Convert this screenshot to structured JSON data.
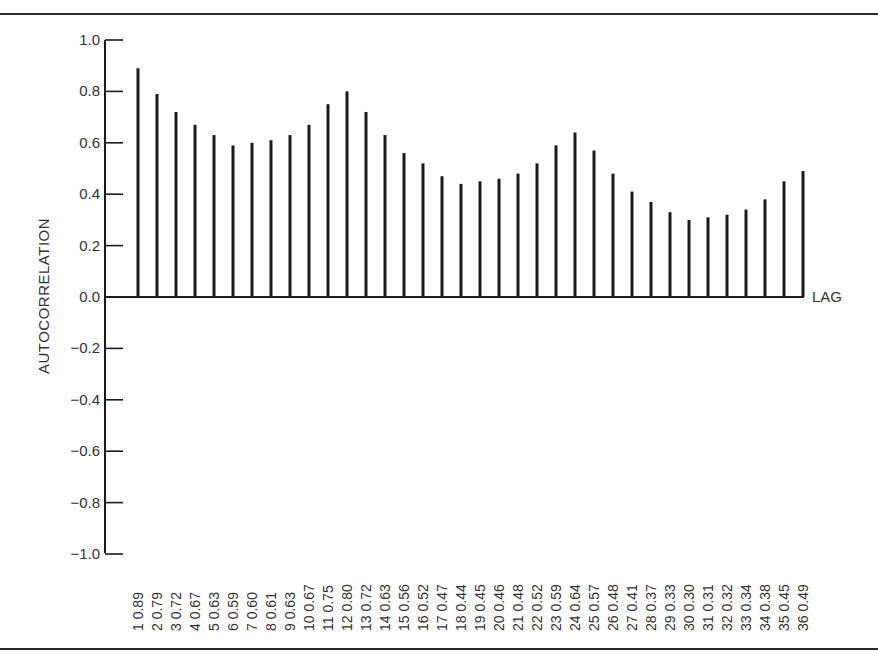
{
  "chart_data": {
    "type": "bar",
    "title": "",
    "xlabel": "LAG",
    "ylabel": "AUTOCORRELATION",
    "ylim": [
      -1.0,
      1.0
    ],
    "yticks": [
      "1.0",
      "0.8",
      "0.6",
      "0.4",
      "0.2",
      "0.0",
      "−0.2",
      "−0.4",
      "−0.6",
      "−0.8",
      "−1.0"
    ],
    "ytick_values": [
      1.0,
      0.8,
      0.6,
      0.4,
      0.2,
      0.0,
      -0.2,
      -0.4,
      -0.6,
      -0.8,
      -1.0
    ],
    "grid": false,
    "legend": null,
    "categories": [
      1,
      2,
      3,
      4,
      5,
      6,
      7,
      8,
      9,
      10,
      11,
      12,
      13,
      14,
      15,
      16,
      17,
      18,
      19,
      20,
      21,
      22,
      23,
      24,
      25,
      26,
      27,
      28,
      29,
      30,
      31,
      32,
      33,
      34,
      35,
      36
    ],
    "values": [
      0.89,
      0.79,
      0.72,
      0.67,
      0.63,
      0.59,
      0.6,
      0.61,
      0.63,
      0.67,
      0.75,
      0.8,
      0.72,
      0.63,
      0.56,
      0.52,
      0.47,
      0.44,
      0.45,
      0.46,
      0.48,
      0.52,
      0.59,
      0.64,
      0.57,
      0.48,
      0.41,
      0.37,
      0.33,
      0.3,
      0.31,
      0.32,
      0.34,
      0.38,
      0.45,
      0.49
    ],
    "tick_labels": [
      "1 0.89",
      "2 0.79",
      "3 0.72",
      "4 0.67",
      "5 0.63",
      "6 0.59",
      "7 0.60",
      "8 0.61",
      "9 0.63",
      "10 0.67",
      "11 0.75",
      "12 0.80",
      "13 0.72",
      "14 0.63",
      "15 0.56",
      "16 0.52",
      "17 0.47",
      "18 0.44",
      "19 0.45",
      "20 0.46",
      "21 0.48",
      "22 0.52",
      "23 0.59",
      "24 0.64",
      "25 0.57",
      "26 0.48",
      "27 0.41",
      "28 0.37",
      "29 0.33",
      "30 0.30",
      "31 0.31",
      "32 0.32",
      "33 0.34",
      "34 0.38",
      "35 0.45",
      "36 0.49"
    ]
  },
  "labels": {
    "ylabel": "AUTOCORRELATION",
    "xlabel": "LAG"
  },
  "colors": {
    "ink": "#1a1a1a",
    "background": "#ffffff"
  }
}
